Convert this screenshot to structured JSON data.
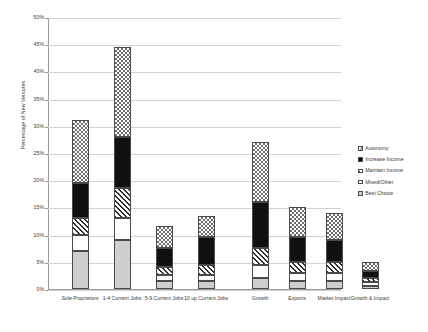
{
  "chart_data": {
    "type": "bar",
    "subtype": "stacked-bar",
    "title": "",
    "xlabel": "",
    "ylabel": "Percentage of New Ventures",
    "ylim": [
      0,
      50
    ],
    "ytick_labels": [
      "0%",
      "5%",
      "10%",
      "15%",
      "20%",
      "25%",
      "30%",
      "35%",
      "40%",
      "45%",
      "50%"
    ],
    "ytick_values": [
      0,
      5,
      10,
      15,
      20,
      25,
      30,
      35,
      40,
      45,
      50
    ],
    "grid": true,
    "legend_position": "right",
    "categories": [
      "Sole Proprietors",
      "1-4 Current Jobs",
      "5-9 Current Jobs",
      "10 up Current Jobs",
      "Growth",
      "Exports",
      "Market Impact",
      "Growth & Impact"
    ],
    "series": [
      {
        "name": "Best Choice",
        "pattern": "solid-gray",
        "values": [
          7.0,
          9.0,
          1.5,
          1.5,
          2.0,
          1.5,
          1.5,
          0.5
        ]
      },
      {
        "name": "Mixed/Other",
        "pattern": "solid-white",
        "values": [
          3.0,
          4.0,
          1.0,
          1.0,
          2.5,
          1.5,
          1.5,
          0.7
        ]
      },
      {
        "name": "Maintain Income",
        "pattern": "diagonal",
        "values": [
          3.0,
          5.5,
          1.5,
          2.0,
          3.0,
          2.0,
          2.0,
          0.8
        ]
      },
      {
        "name": "Increase Income",
        "pattern": "solid-black",
        "values": [
          6.5,
          9.5,
          3.5,
          5.0,
          8.5,
          4.5,
          4.0,
          1.3
        ]
      },
      {
        "name": "Autonomy",
        "pattern": "checkered",
        "values": [
          11.5,
          16.5,
          4.0,
          4.0,
          11.0,
          5.5,
          5.0,
          1.7
        ]
      }
    ],
    "totals": [
      31.0,
      44.5,
      11.5,
      13.5,
      27.0,
      15.0,
      14.0,
      5.0
    ]
  },
  "legend": {
    "items": [
      {
        "label": "Autonomy",
        "pattern": "checkered"
      },
      {
        "label": "Increase Income",
        "pattern": "solid-black"
      },
      {
        "label": "Maintain Income",
        "pattern": "diagonal"
      },
      {
        "label": "Mixed/Other",
        "pattern": "solid-white"
      },
      {
        "label": "Best Choice",
        "pattern": "solid-gray"
      }
    ]
  },
  "colors": {
    "axis": "#9a9a9a",
    "gridline": "#d2d2d2",
    "text": "#3a3a3a",
    "bar_outline": "#4a4a4a",
    "best_choice": "#cfcfcf",
    "increase_income": "#111111",
    "background": "#ffffff"
  }
}
